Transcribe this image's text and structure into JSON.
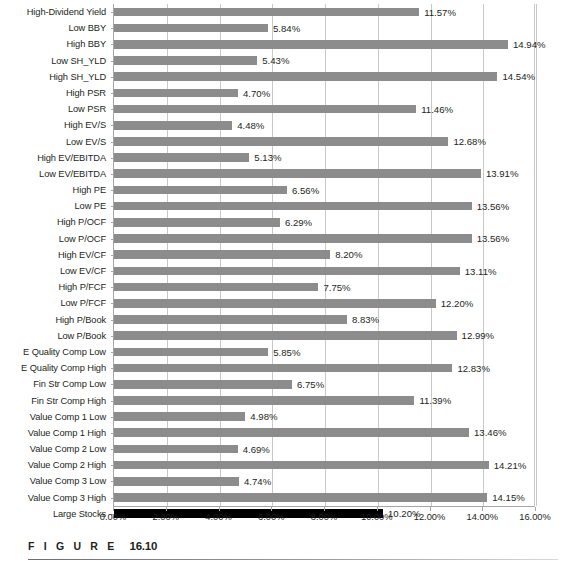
{
  "caption": {
    "word": "F I G U R E",
    "number": "16.10"
  },
  "chart_data": {
    "type": "bar",
    "orientation": "horizontal",
    "title": "",
    "xlabel": "",
    "ylabel": "",
    "xlim": [
      0,
      16
    ],
    "grid": true,
    "legend": "none",
    "value_suffix": "%",
    "tick_labels": [
      "0.00%",
      "2.00%",
      "4.00%",
      "6.00%",
      "8.00%",
      "10.00%",
      "12.00%",
      "14.00%",
      "16.00%"
    ],
    "tick_values": [
      0,
      2,
      4,
      6,
      8,
      10,
      12,
      14,
      16
    ],
    "bar_color": "#8c8c8c",
    "highlight_color": "#000000",
    "highlight_category": "Large Stocks",
    "categories": [
      "High-Dividend Yield",
      "Low BBY",
      "High BBY",
      "Low SH_YLD",
      "High SH_YLD",
      "High PSR",
      "Low PSR",
      "High EV/S",
      "Low EV/S",
      "High EV/EBITDA",
      "Low EV/EBITDA",
      "High PE",
      "Low PE",
      "High P/OCF",
      "Low P/OCF",
      "High EV/CF",
      "Low EV/CF",
      "High P/FCF",
      "Low P/FCF",
      "High P/Book",
      "Low P/Book",
      "E Quality Comp Low",
      "E Quality Comp High",
      "Fin Str Comp Low",
      "Fin Str Comp High",
      "Value Comp 1 Low",
      "Value Comp 1 High",
      "Value Comp 2 Low",
      "Value Comp 2 High",
      "Value Comp 3 Low",
      "Value Comp 3 High",
      "Large Stocks"
    ],
    "values": [
      11.57,
      5.84,
      14.94,
      5.43,
      14.54,
      4.7,
      11.46,
      4.48,
      12.68,
      5.13,
      13.91,
      6.56,
      13.56,
      6.29,
      13.56,
      8.2,
      13.11,
      7.75,
      12.2,
      8.83,
      12.99,
      5.85,
      12.83,
      6.75,
      11.39,
      4.98,
      13.46,
      4.69,
      14.21,
      4.74,
      14.15,
      10.2
    ],
    "labels": [
      "11.57%",
      "5.84%",
      "14.94%",
      "5.43%",
      "14.54%",
      "4.70%",
      "11.46%",
      "4.48%",
      "12.68%",
      "5.13%",
      "13.91%",
      "6.56%",
      "13.56%",
      "6.29%",
      "13.56%",
      "8.20%",
      "13.11%",
      "7.75%",
      "12.20%",
      "8.83%",
      "12.99%",
      "5.85%",
      "12.83%",
      "6.75%",
      "11.39%",
      "4.98%",
      "13.46%",
      "4.69%",
      "14.21%",
      "4.74%",
      "14.15%",
      "10.20%"
    ]
  }
}
